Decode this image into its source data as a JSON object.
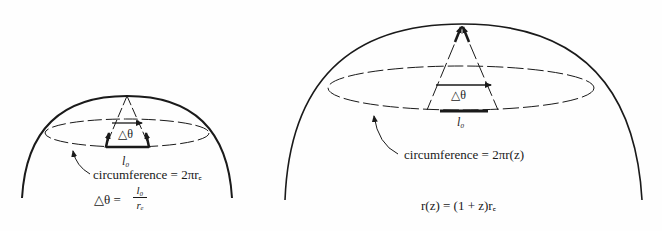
{
  "left_panel": {
    "delta_theta_label": "△θ",
    "l0_label": "l₀",
    "circumference_label": "circumference = 2πrₑ",
    "equation_lhs": "△θ =",
    "equation_num": "l₀",
    "equation_den": "rₑ"
  },
  "right_panel": {
    "delta_theta_label": "△θ",
    "l0_label": "l₀",
    "circumference_label": "circumference = 2πr(z)",
    "equation": "r(z) = (1 + z)rₑ"
  }
}
